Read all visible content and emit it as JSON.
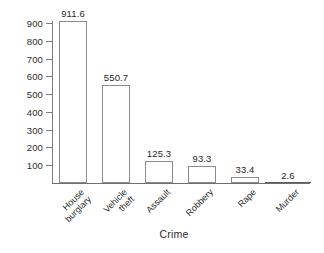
{
  "chart_data": {
    "type": "bar",
    "title": "",
    "subtitle": "",
    "xlabel": "Crime",
    "ylabel": "",
    "categories": [
      "House burglary",
      "Vehicle theft",
      "Assault",
      "Robbery",
      "Rape",
      "Murder"
    ],
    "category_lines": [
      [
        "House",
        "burglary"
      ],
      [
        "Vehicle",
        "theft"
      ],
      [
        "Assault"
      ],
      [
        "Robbery"
      ],
      [
        "Rape"
      ],
      [
        "Murder"
      ]
    ],
    "values": [
      911.6,
      550.7,
      125.3,
      93.3,
      33.4,
      2.6
    ],
    "value_labels": [
      "911.6",
      "550.7",
      "125.3",
      "93.3",
      "33.4",
      "2.6"
    ],
    "ylim": [
      0,
      950
    ],
    "y_ticks": [
      100,
      200,
      300,
      400,
      500,
      600,
      700,
      800,
      900
    ],
    "y_tick_labels": [
      "100",
      "200",
      "300",
      "400",
      "500",
      "600",
      "700",
      "800",
      "900"
    ],
    "grid": false,
    "legend": false,
    "legend_position": "none",
    "bar_fill_color": "#ffffff",
    "bar_edge_color": "#8b8b8b",
    "axis_color": "#7d7d7d",
    "text_color": "#2b2b2b",
    "background_color": "#ffffff",
    "label_rotation": -45
  }
}
